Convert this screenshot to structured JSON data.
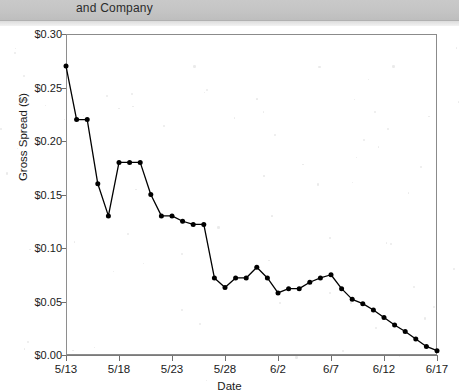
{
  "header": {
    "running_head": "and Company"
  },
  "chart_data": {
    "type": "line",
    "title": "",
    "xlabel": "Date",
    "ylabel": "Gross Spread ($)",
    "xlim": [
      0,
      35
    ],
    "ylim": [
      0.0,
      0.3
    ],
    "grid": false,
    "legend": "none",
    "marker": "filled-circle",
    "line_color": "#000000",
    "y_ticks": [
      "$0.00",
      "$0.05",
      "$0.10",
      "$0.15",
      "$0.20",
      "$0.25",
      "$0.30"
    ],
    "y_tick_values": [
      0.0,
      0.05,
      0.1,
      0.15,
      0.2,
      0.25,
      0.3
    ],
    "x_ticks": [
      "5/13",
      "5/18",
      "5/23",
      "5/28",
      "6/2",
      "6/7",
      "6/12",
      "6/17"
    ],
    "x_tick_values": [
      0,
      5,
      10,
      15,
      20,
      25,
      30,
      35
    ],
    "x": [
      0,
      1,
      2,
      3,
      4,
      5,
      6,
      7,
      8,
      9,
      10,
      11,
      12,
      13,
      14,
      15,
      16,
      17,
      18,
      19,
      20,
      21,
      22,
      23,
      24,
      25,
      26,
      27,
      28,
      29,
      30,
      31,
      32,
      33,
      34,
      35
    ],
    "categories": [
      "5/13",
      "5/14",
      "5/15",
      "5/16",
      "5/17",
      "5/18",
      "5/19",
      "5/20",
      "5/21",
      "5/22",
      "5/23",
      "5/24",
      "5/25",
      "5/26",
      "5/27",
      "5/28",
      "5/29",
      "5/30",
      "5/31",
      "6/1",
      "6/2",
      "6/3",
      "6/4",
      "6/5",
      "6/6",
      "6/7",
      "6/8",
      "6/9",
      "6/10",
      "6/11",
      "6/12",
      "6/13",
      "6/14",
      "6/15",
      "6/16",
      "6/17"
    ],
    "values": [
      0.27,
      0.22,
      0.22,
      0.16,
      0.13,
      0.18,
      0.18,
      0.18,
      0.15,
      0.13,
      0.13,
      0.125,
      0.122,
      0.122,
      0.072,
      0.063,
      0.072,
      0.072,
      0.082,
      0.072,
      0.058,
      0.062,
      0.062,
      0.068,
      0.072,
      0.075,
      0.062,
      0.052,
      0.048,
      0.042,
      0.035,
      0.028,
      0.022,
      0.015,
      0.008,
      0.004
    ],
    "series": [
      {
        "name": "Gross Spread",
        "values": [
          0.27,
          0.22,
          0.22,
          0.16,
          0.13,
          0.18,
          0.18,
          0.18,
          0.15,
          0.13,
          0.13,
          0.125,
          0.122,
          0.122,
          0.072,
          0.063,
          0.072,
          0.072,
          0.082,
          0.072,
          0.058,
          0.062,
          0.062,
          0.068,
          0.072,
          0.075,
          0.062,
          0.052,
          0.048,
          0.042,
          0.035,
          0.028,
          0.022,
          0.015,
          0.008,
          0.004
        ]
      }
    ]
  }
}
